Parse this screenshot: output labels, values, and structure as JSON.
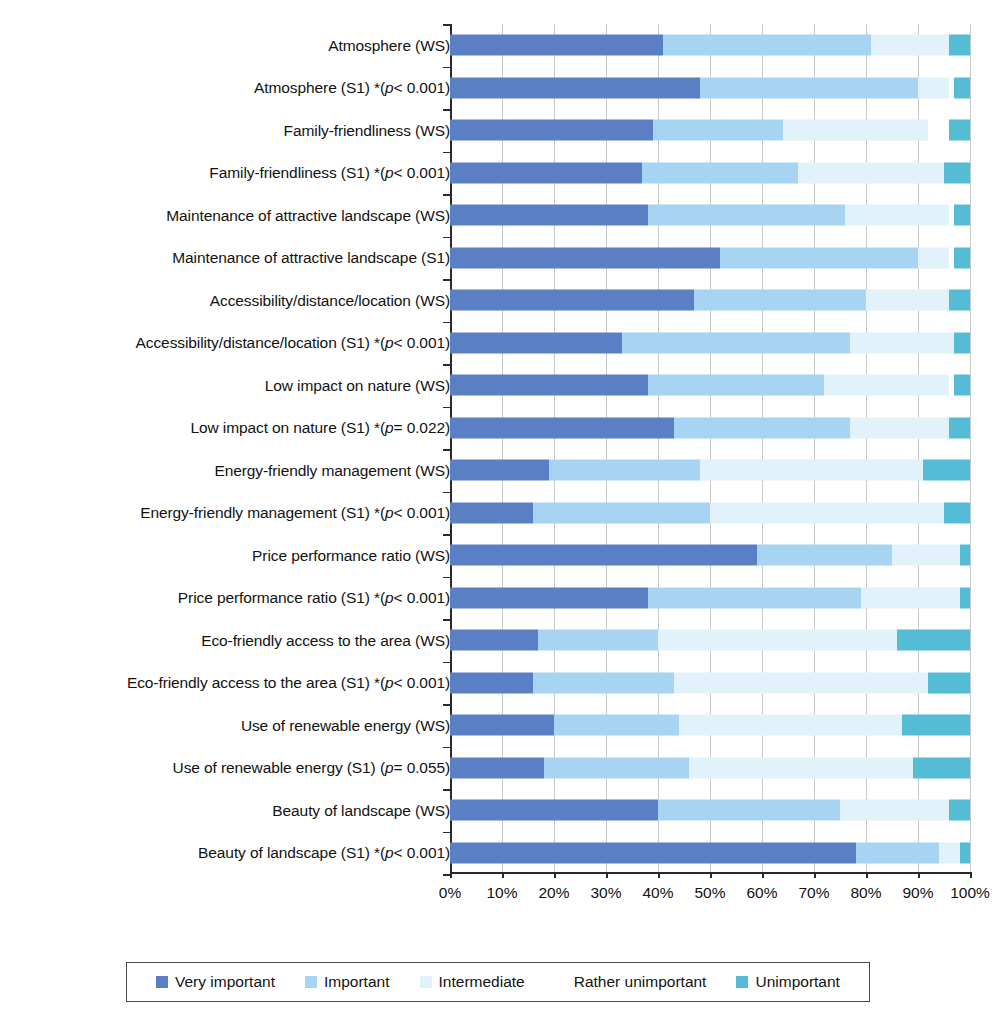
{
  "chart_data": {
    "type": "bar",
    "orientation": "horizontal",
    "stacked": true,
    "stacked_percent": true,
    "title": "",
    "xlabel": "",
    "ylabel": "",
    "xlim": [
      0,
      100
    ],
    "grid": true,
    "legend_position": "bottom",
    "xticks": [
      "0%",
      "10%",
      "20%",
      "30%",
      "40%",
      "50%",
      "60%",
      "70%",
      "80%",
      "90%",
      "100%"
    ],
    "xtick_values": [
      0,
      10,
      20,
      30,
      40,
      50,
      60,
      70,
      80,
      90,
      100
    ],
    "series": [
      {
        "name": "Very important",
        "color": "#5b7fc4"
      },
      {
        "name": "Important",
        "color": "#a6d4f2"
      },
      {
        "name": "Intermediate",
        "color": "#e2f2fb"
      },
      {
        "name": "Rather unimportant",
        "color": "#ffffff"
      },
      {
        "name": "Unimportant",
        "color": "#55bcd6"
      }
    ],
    "categories": [
      "Atmosphere (WS)",
      "Atmosphere (S1) *(p < 0.001)",
      "Family-friendliness (WS)",
      "Family-friendliness (S1) *(p < 0.001)",
      "Maintenance of attractive landscape (WS)",
      "Maintenance of attractive landscape (S1)",
      "Accessibility/distance/location (WS)",
      "Accessibility/distance/location (S1) *(p < 0.001)",
      "Low impact on nature (WS)",
      "Low impact on nature (S1) *(p = 0.022)",
      "Energy-friendly management (WS)",
      "Energy-friendly management (S1) *(p < 0.001)",
      "Price performance ratio (WS)",
      "Price performance ratio (S1) *(p < 0.001)",
      "Eco-friendly access to the area (WS)",
      "Eco-friendly access to the area (S1) *(p < 0.001)",
      "Use of renewable energy (WS)",
      "Use of renewable energy (S1) (p = 0.055)",
      "Beauty of landscape (WS)",
      "Beauty of landscape (S1) *(p < 0.001)"
    ],
    "values": [
      [
        41,
        40,
        15,
        0,
        4
      ],
      [
        48,
        42,
        6,
        1,
        3
      ],
      [
        39,
        25,
        28,
        4,
        4
      ],
      [
        37,
        30,
        28,
        0,
        5
      ],
      [
        38,
        38,
        20,
        1,
        3
      ],
      [
        52,
        38,
        6,
        1,
        3
      ],
      [
        47,
        33,
        16,
        0,
        4
      ],
      [
        33,
        44,
        20,
        0,
        3
      ],
      [
        38,
        34,
        24,
        1,
        3
      ],
      [
        43,
        34,
        19,
        0,
        4
      ],
      [
        19,
        29,
        43,
        0,
        9
      ],
      [
        16,
        34,
        45,
        0,
        5
      ],
      [
        59,
        26,
        13,
        0,
        2
      ],
      [
        38,
        41,
        19,
        0,
        2
      ],
      [
        17,
        23,
        46,
        0,
        14
      ],
      [
        16,
        27,
        49,
        0,
        8
      ],
      [
        20,
        24,
        43,
        0,
        13
      ],
      [
        18,
        28,
        43,
        0,
        11
      ],
      [
        40,
        35,
        21,
        0,
        4
      ],
      [
        78,
        16,
        4,
        0,
        2
      ]
    ],
    "legend": [
      "Very important",
      "Important",
      "Intermediate",
      "Rather unimportant",
      "Unimportant"
    ]
  }
}
